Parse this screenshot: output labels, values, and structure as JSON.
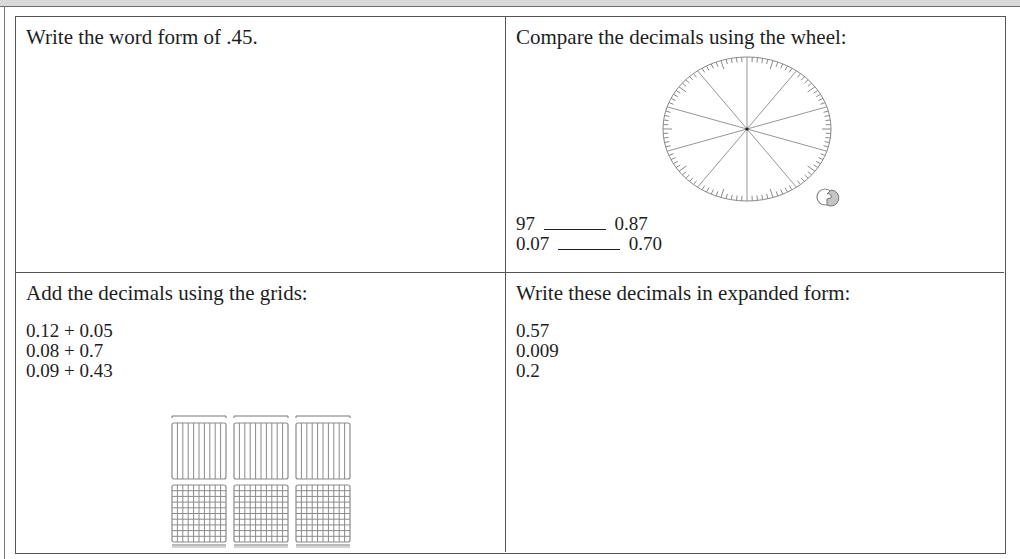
{
  "worksheet": {
    "cells": [
      {
        "position": "top-left",
        "prompt": "Write the word form of .45."
      },
      {
        "position": "top-right",
        "prompt": "Compare the decimals using the wheel:",
        "comparisons": [
          {
            "left": "97",
            "blank": "______",
            "right": "0.87"
          },
          {
            "left": "0.07",
            "blank": "______",
            "right": "0.70"
          }
        ],
        "figure": "decimal-comparison-wheel"
      },
      {
        "position": "bottom-left",
        "prompt": "Add the decimals using the grids:",
        "problems": [
          "0.12 + 0.05",
          "0.08 + 0.7",
          "0.09 + 0.43"
        ],
        "figure": "tenths-and-hundredths-grids",
        "grid_columns": 3
      },
      {
        "position": "bottom-right",
        "prompt": "Write these decimals in expanded form:",
        "items": [
          "0.57",
          "0.009",
          "0.2"
        ]
      }
    ]
  },
  "colors": {
    "border": "#555555",
    "text": "#1e1e1e",
    "figure_lines": "#8a8a8a",
    "top_strip": "#d9d9d9"
  }
}
